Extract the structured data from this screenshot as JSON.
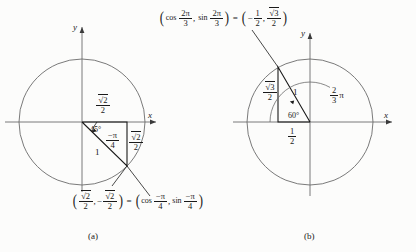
{
  "figure": {
    "background_color": "#fcfcfb",
    "ink_color": "#1a1a1a",
    "axis_color": "#6b6b6b",
    "circle_color": "#6b6b6b"
  },
  "panel_a": {
    "caption": "(a)",
    "axis_x_label": "x",
    "axis_y_label": "y",
    "angle_deg_label": "45°",
    "angle_rad_numerator": "−π",
    "angle_rad_denominator": "4",
    "hypotenuse_label": "1",
    "horizontal_leg": {
      "numerator": "√2",
      "denominator": "2"
    },
    "vertical_leg": {
      "numerator": "√2",
      "denominator": "2"
    },
    "equation": {
      "left_x": {
        "numerator": "√2",
        "denominator": "2"
      },
      "left_y_sign": "−",
      "left_y": {
        "numerator": "√2",
        "denominator": "2"
      },
      "equals": "=",
      "right_cos": "cos",
      "right_cos_num": "−π",
      "right_cos_den": "4",
      "right_sin": "sin",
      "right_sin_num": "−π",
      "right_sin_den": "4",
      "comma": ","
    }
  },
  "panel_b": {
    "caption": "(b)",
    "axis_x_label": "x",
    "axis_y_label": "y",
    "angle_deg_label": "60°",
    "arc_angle_numerator": "2",
    "arc_angle_denominator": "3",
    "arc_angle_symbol": "π",
    "hypotenuse_label": "1",
    "vertical_leg": {
      "numerator": "√3",
      "denominator": "2"
    },
    "horizontal_leg": {
      "numerator": "1",
      "denominator": "2"
    },
    "equation": {
      "left_cos": "cos",
      "left_cos_num": "2π",
      "left_cos_den": "3",
      "left_sin": "sin",
      "left_sin_num": "2π",
      "left_sin_den": "3",
      "equals": "=",
      "right_x_sign": "−",
      "right_x": {
        "numerator": "1",
        "denominator": "2"
      },
      "right_y": {
        "numerator": "√3",
        "denominator": "2"
      },
      "comma": ","
    }
  }
}
